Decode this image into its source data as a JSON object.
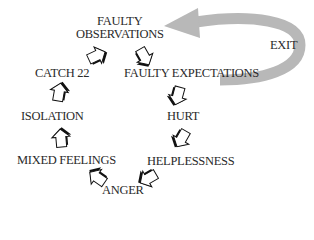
{
  "diagram": {
    "type": "cycle",
    "nodes": [
      {
        "id": "faulty_observations",
        "label_line1": "FAULTY",
        "label_line2": "OBSERVATIONS"
      },
      {
        "id": "faulty_expectations",
        "label": "FAULTY EXPECTATIONS"
      },
      {
        "id": "hurt",
        "label": "HURT"
      },
      {
        "id": "helplessness",
        "label": "HELPLESSNESS"
      },
      {
        "id": "anger",
        "label": "ANGER"
      },
      {
        "id": "mixed_feelings",
        "label": "MIXED FEELINGS"
      },
      {
        "id": "isolation",
        "label": "ISOLATION"
      },
      {
        "id": "catch_22",
        "label": "CATCH 22"
      }
    ],
    "edges": [
      [
        "faulty_observations",
        "faulty_expectations"
      ],
      [
        "faulty_expectations",
        "hurt"
      ],
      [
        "hurt",
        "helplessness"
      ],
      [
        "helplessness",
        "anger"
      ],
      [
        "anger",
        "mixed_feelings"
      ],
      [
        "mixed_feelings",
        "isolation"
      ],
      [
        "isolation",
        "catch_22"
      ],
      [
        "catch_22",
        "faulty_observations"
      ]
    ],
    "exit": {
      "label": "EXIT",
      "from": "faulty_expectations",
      "to": "faulty_observations",
      "color": "#b8b8b8"
    },
    "colors": {
      "text": "#2a2a2a",
      "arrow_fill": "#ffffff",
      "arrow_stroke": "#111111",
      "exit_arrow": "#b8b8b8"
    }
  }
}
